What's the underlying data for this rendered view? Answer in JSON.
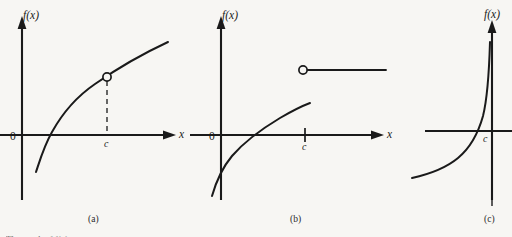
{
  "figure": {
    "background_color": "#f7f6f3",
    "ink_color": "#1a1a1a",
    "bottom_cut_text": "The graph of f(x) at x",
    "panels": [
      {
        "id": "a",
        "caption": "(a)",
        "y_axis_label": "f(x)",
        "x_axis_label": "x",
        "origin_label": "0",
        "point_label": "c",
        "discontinuity_type": "removable",
        "marker": "open-circle",
        "connector": "dashed-vertical",
        "description": "Increasing concave-down curve crossing the x-axis, with an open circle on the curve at x = c joined to the axis by a dashed vertical line."
      },
      {
        "id": "b",
        "caption": "(b)",
        "y_axis_label": "f(x)",
        "x_axis_label": "x",
        "origin_label": "0",
        "point_label": "c",
        "discontinuity_type": "jump",
        "marker": "open-circle",
        "connector": "axis-tick",
        "description": "Increasing concave-down curve ending to the left of c, with a separate horizontal ray starting at an open circle above and right of c; a short tick marks c on the x-axis."
      },
      {
        "id": "c",
        "caption": "(c)",
        "y_axis_label": "f(x)",
        "point_label": "c",
        "discontinuity_type": "infinite",
        "marker": "vertical-asymptote",
        "connector": "dashed-vertical-asymptote",
        "description": "Curve rising steeply toward a vertical dashed asymptote at x = c; the panel is cropped at the right edge of the image."
      }
    ]
  }
}
